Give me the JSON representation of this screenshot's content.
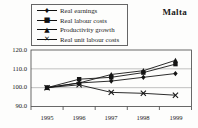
{
  "title": "Malta",
  "chart_data": {
    "type": "line",
    "title": "Malta",
    "categories": [
      "1995",
      "1996",
      "1997",
      "1998",
      "1999"
    ],
    "ylim": [
      90,
      120
    ],
    "yticks": [
      90,
      100,
      110,
      120
    ],
    "ytick_labels": [
      "120.0",
      "110.0",
      "100.0",
      "90.0"
    ],
    "grid": "horizontal",
    "legend_position": "top-left-box",
    "line_color": "#151515",
    "series": [
      {
        "name": "Real earnings",
        "marker": "diamond",
        "color": "#151515",
        "values": [
          100,
          102.5,
          103.5,
          105.5,
          107.5
        ]
      },
      {
        "name": "Real labour costs",
        "marker": "square",
        "color": "#151515",
        "values": [
          100,
          104.5,
          105.5,
          108,
          112.5
        ]
      },
      {
        "name": "Productivity growth",
        "marker": "triangle",
        "color": "#151515",
        "values": [
          100,
          102.5,
          107,
          109,
          114.5
        ]
      },
      {
        "name": "Real unit labour costs",
        "marker": "x-cross",
        "color": "#151515",
        "values": [
          100,
          101.5,
          97.5,
          97,
          96
        ]
      }
    ]
  }
}
